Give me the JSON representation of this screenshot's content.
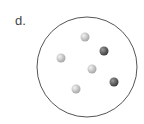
{
  "label": "d.",
  "container": {
    "cx": 87,
    "cy": 67,
    "r": 50,
    "stroke": "#555555"
  },
  "particles": [
    {
      "type": "light",
      "cx": 85,
      "cy": 37
    },
    {
      "type": "dark",
      "cx": 104,
      "cy": 51
    },
    {
      "type": "light",
      "cx": 61,
      "cy": 58
    },
    {
      "type": "light",
      "cx": 92,
      "cy": 69
    },
    {
      "type": "dark",
      "cx": 114,
      "cy": 82
    },
    {
      "type": "light",
      "cx": 76,
      "cy": 89
    }
  ],
  "colors": {
    "light": "#c8c8c8",
    "dark": "#6a6a6a"
  }
}
